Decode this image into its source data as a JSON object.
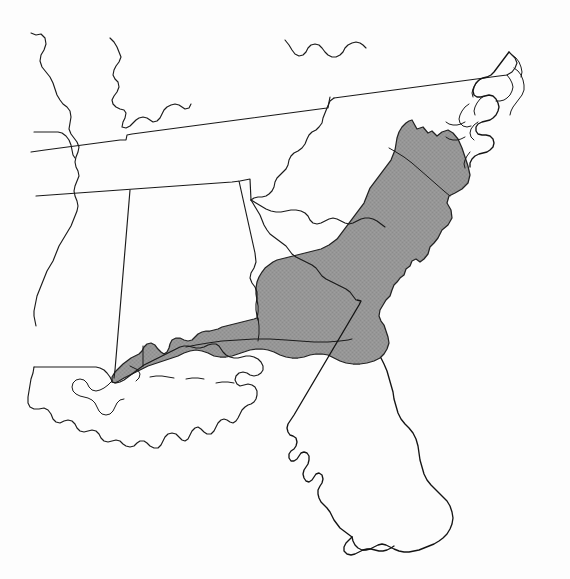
{
  "figure": {
    "kind": "species-range-map",
    "title": "",
    "caption": "",
    "region": "Southeastern United States",
    "background_color": "#fdfdfd",
    "outline_color": "#1a1a1a",
    "range_fill_color": "#949494",
    "range_stroke_color": "#222222"
  },
  "legend": {
    "visible": false,
    "entries": [
      {
        "label": "",
        "swatch_color": "#949494",
        "pattern": "halftone-gray"
      }
    ]
  },
  "map_data": {
    "type": "choropleth-range",
    "projection_hint": "tilted-equirectangular",
    "shaded_label": "",
    "shaded_states": [
      "North Carolina",
      "South Carolina",
      "Georgia",
      "Florida",
      "Alabama",
      "Mississippi",
      "Louisiana"
    ],
    "unshaded_states": [
      "Arkansas",
      "Tennessee",
      "Kentucky",
      "Virginia"
    ],
    "shaded_description": "Atlantic and Gulf Coastal Plain from southeastern Virginia and the Carolinas south through Georgia into peninsular Florida, and west along the Gulf Coast through the Florida Panhandle, southern Alabama and Mississippi to southeastern Louisiana",
    "annotations": []
  },
  "geometry": {
    "viewbox": "0 0 570 579",
    "units": "pixels",
    "note": "Hand-traced political outlines of the southeastern United States with a single shaded distribution polygon."
  }
}
